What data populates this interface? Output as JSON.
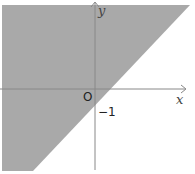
{
  "figure": {
    "axes": {
      "x_label": "x",
      "y_label": "y",
      "origin_label": "O",
      "y_intercept_label": "−1"
    },
    "boundary_line": {
      "slope": 1,
      "intercept": -1
    },
    "shaded_side": "above-left",
    "colors": {
      "shade": "#a9a9a9",
      "axis": "#888888",
      "background": "#ffffff"
    }
  }
}
